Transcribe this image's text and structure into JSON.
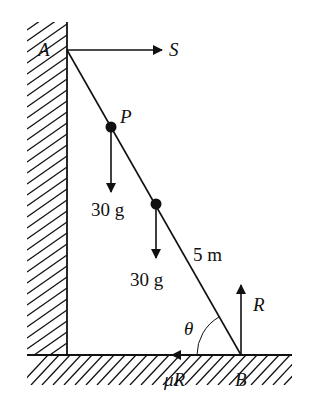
{
  "diagram": {
    "type": "ladder-against-wall",
    "points": {
      "A": "A",
      "B": "B",
      "P": "P"
    },
    "forces": {
      "S": "S",
      "R": "R",
      "friction": "μR",
      "weight1": "30 g",
      "weight2": "30 g"
    },
    "length_label": "5 m",
    "angle_label": "θ",
    "colors": {
      "ink": "#111111",
      "background": "#ffffff"
    }
  }
}
